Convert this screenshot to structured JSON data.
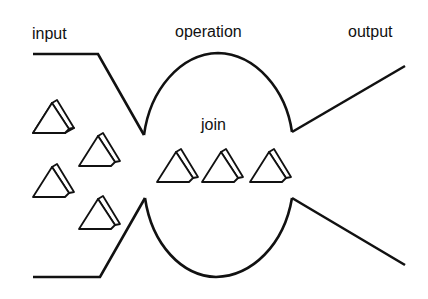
{
  "diagram": {
    "labels": {
      "input": "input",
      "operation": "operation",
      "output": "output",
      "join": "join"
    },
    "colors": {
      "line": "#111111",
      "background": "#ffffff"
    },
    "tokens": {
      "input_queue_count": 5,
      "join_queue_count": 3,
      "shape": "triangular-prism"
    }
  }
}
